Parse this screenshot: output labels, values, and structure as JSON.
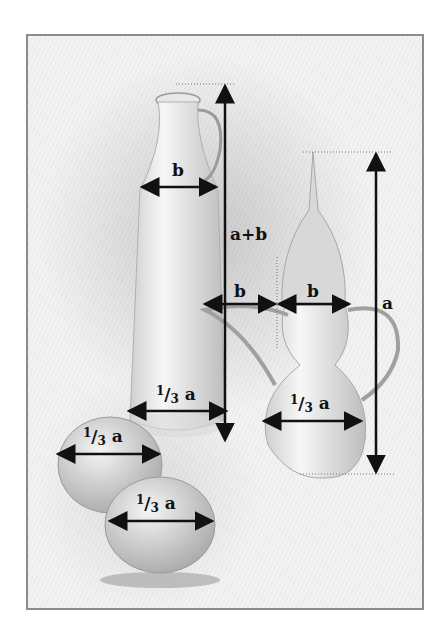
{
  "figure": {
    "objects": [
      "bottle",
      "coffee-pot",
      "apple-left",
      "apple-front"
    ]
  },
  "labels": {
    "bottle_neck_width": "b",
    "bottle_height": "a+b",
    "spout_width": "b",
    "lid_width": "b",
    "pot_height": "a",
    "frac_num": "1",
    "frac_slash": "/",
    "frac_den": "3",
    "frac_var": " a",
    "bottle_base_width": "1/3 a",
    "pot_body_width": "1/3 a",
    "apple_left_width": "1/3 a",
    "apple_front_width": "1/3 a"
  },
  "colors": {
    "frame_border": "#8c8c8c",
    "paper": "#f2f2f2",
    "arrow": "#111111"
  }
}
